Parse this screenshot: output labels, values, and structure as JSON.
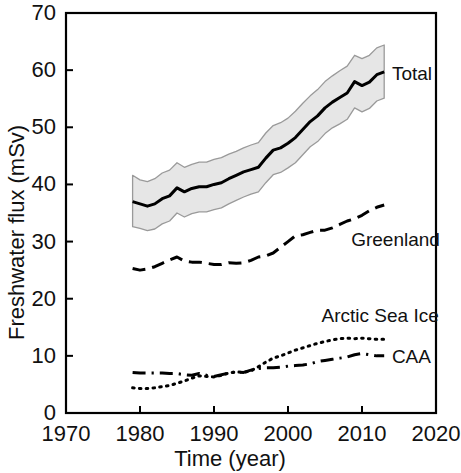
{
  "chart_data": {
    "type": "line",
    "title": "",
    "xlabel": "Time (year)",
    "ylabel": "Freshwater flux (mSv)",
    "xlim": [
      1970,
      2020
    ],
    "ylim": [
      0,
      70
    ],
    "xticks": [
      1970,
      1980,
      1990,
      2000,
      2010,
      2020
    ],
    "yticks": [
      0,
      10,
      20,
      30,
      40,
      50,
      60,
      70
    ],
    "xtick_labels": [
      "1970",
      "1980",
      "1990",
      "2000",
      "2010",
      "2020"
    ],
    "ytick_labels": [
      "0",
      "10",
      "20",
      "30",
      "40",
      "50",
      "60",
      "70"
    ],
    "grid": false,
    "legend_position": "inline-right-of-series",
    "x": [
      1979,
      1980,
      1981,
      1982,
      1983,
      1984,
      1985,
      1986,
      1987,
      1988,
      1989,
      1990,
      1991,
      1992,
      1993,
      1994,
      1995,
      1996,
      1997,
      1998,
      1999,
      2000,
      2001,
      2002,
      2003,
      2004,
      2005,
      2006,
      2007,
      2008,
      2009,
      2010,
      2011,
      2012,
      2013
    ],
    "series": [
      {
        "name": "Total",
        "style": "solid",
        "linewidth": 3,
        "color": "#000000",
        "has_uncertainty_band": true,
        "band_color": "#e6e6e6",
        "band_edge_color": "#9a9a9a",
        "values": [
          37.0,
          36.6,
          36.2,
          36.6,
          37.5,
          38.0,
          39.4,
          38.7,
          39.3,
          39.6,
          39.6,
          40.0,
          40.3,
          41.0,
          41.6,
          42.2,
          42.6,
          43.0,
          44.6,
          46.0,
          46.4,
          47.2,
          48.2,
          49.6,
          51.0,
          52.0,
          53.4,
          54.4,
          55.2,
          56.0,
          58.0,
          57.3,
          57.9,
          59.2,
          59.7
        ],
        "band_upper": [
          41.6,
          40.8,
          40.5,
          41.0,
          42.0,
          42.5,
          43.8,
          43.0,
          43.5,
          43.9,
          43.9,
          44.4,
          44.7,
          45.3,
          45.8,
          46.4,
          46.9,
          47.3,
          49.0,
          50.3,
          50.8,
          51.6,
          52.8,
          54.2,
          55.5,
          56.6,
          58.0,
          59.0,
          59.9,
          60.7,
          62.6,
          62.0,
          62.6,
          63.9,
          64.4
        ],
        "band_lower": [
          32.6,
          32.3,
          31.9,
          32.2,
          33.1,
          33.6,
          35.0,
          34.3,
          34.9,
          35.2,
          35.2,
          35.6,
          35.9,
          36.6,
          37.2,
          37.8,
          38.3,
          38.7,
          40.3,
          41.7,
          42.1,
          42.9,
          43.8,
          45.2,
          46.6,
          47.5,
          48.9,
          49.9,
          50.6,
          51.4,
          53.4,
          52.7,
          53.3,
          54.6,
          55.1
        ],
        "label": "Total",
        "label_x": 2013.5,
        "label_y": 59.5
      },
      {
        "name": "Greenland",
        "style": "dashed",
        "linewidth": 3,
        "color": "#000000",
        "values": [
          25.3,
          25.0,
          25.2,
          25.6,
          26.2,
          26.8,
          27.3,
          26.6,
          26.4,
          26.4,
          26.2,
          26.0,
          26.0,
          26.3,
          26.2,
          26.3,
          26.7,
          27.3,
          27.5,
          28.0,
          29.0,
          30.0,
          31.0,
          31.2,
          31.6,
          32.0,
          32.0,
          32.4,
          33.0,
          33.6,
          34.0,
          34.6,
          35.4,
          36.0,
          36.4
        ],
        "label": "Greenland",
        "label_x": 2008.0,
        "label_y": 30.4
      },
      {
        "name": "Arctic Sea Ice",
        "style": "dotted",
        "linewidth": 3,
        "color": "#000000",
        "values": [
          4.4,
          4.3,
          4.3,
          4.4,
          4.6,
          4.8,
          5.2,
          5.6,
          6.1,
          6.5,
          6.4,
          6.3,
          6.6,
          7.0,
          7.2,
          7.1,
          7.4,
          8.1,
          8.9,
          9.6,
          10.0,
          10.5,
          11.0,
          11.4,
          11.8,
          12.2,
          12.5,
          12.8,
          13.0,
          13.1,
          13.0,
          13.1,
          13.0,
          12.9,
          12.9
        ],
        "label": "Arctic Sea Ice",
        "label_x": 2004.0,
        "label_y": 17.2
      },
      {
        "name": "CAA",
        "style": "dashdot",
        "linewidth": 3,
        "color": "#000000",
        "values": [
          7.1,
          7.0,
          7.0,
          7.0,
          7.0,
          6.9,
          6.9,
          6.7,
          6.6,
          6.9,
          6.6,
          6.4,
          6.7,
          7.0,
          7.2,
          7.1,
          7.5,
          7.8,
          7.9,
          7.9,
          8.0,
          8.2,
          8.3,
          8.4,
          8.6,
          9.0,
          9.2,
          9.4,
          9.6,
          9.8,
          10.2,
          10.4,
          10.2,
          10.0,
          10.0
        ],
        "label": "CAA",
        "label_x": 2013.5,
        "label_y": 10.0
      }
    ]
  },
  "axes": {
    "xlabel": "Time (year)",
    "ylabel": "Freshwater flux (mSv)"
  }
}
